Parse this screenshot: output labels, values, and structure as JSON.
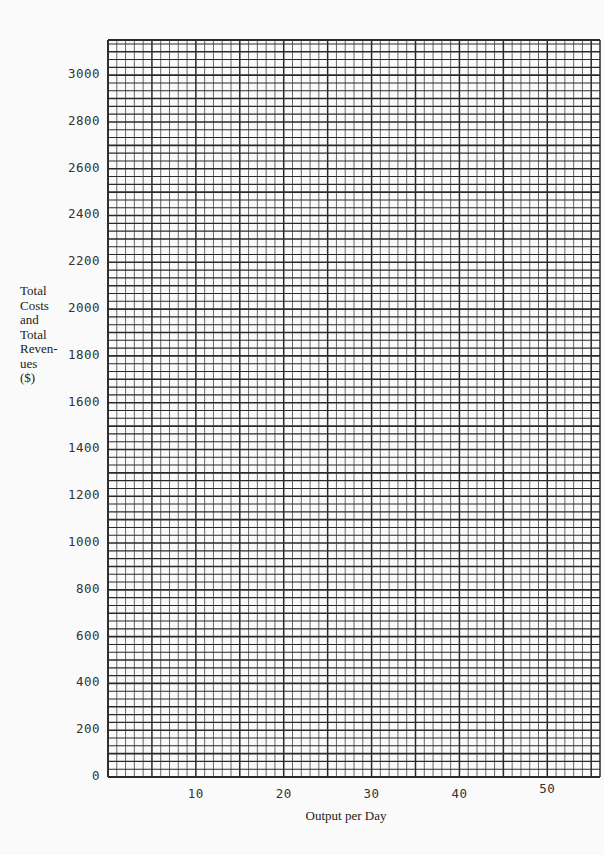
{
  "chart_data": {
    "type": "line",
    "title": "",
    "xlabel": "Output per Day",
    "ylabel": "Total\nCosts\nand\nTotal\nReven-\nues\n($)",
    "x_ticks": [
      10,
      20,
      30,
      40,
      50
    ],
    "y_ticks": [
      0,
      200,
      400,
      600,
      800,
      1000,
      1200,
      1400,
      1600,
      1800,
      2000,
      2200,
      2400,
      2600,
      2800,
      3000
    ],
    "xlim": [
      0,
      56
    ],
    "ylim": [
      0,
      3150
    ],
    "grid": true,
    "grid_minor_x_step": 1,
    "grid_major_x_step": 5,
    "grid_minor_y_step": 33.33,
    "series": [],
    "note": "Blank graph paper grid with no plotted data"
  },
  "axis": {
    "ylabel_lines": "Total\nCosts\nand\nTotal\nReven-\nues\n($)",
    "xlabel": "Output per Day",
    "y_ticks": [
      "0",
      "200",
      "400",
      "600",
      "800",
      "1000",
      "1200",
      "1400",
      "1600",
      "1800",
      "2000",
      "2200",
      "2400",
      "2600",
      "2800",
      "3000"
    ],
    "x_ticks": [
      "10",
      "20",
      "30",
      "40",
      "50"
    ]
  },
  "colors": {
    "grid_line": "#2a2a2a",
    "background": "#fafafa",
    "text": "#222222"
  }
}
